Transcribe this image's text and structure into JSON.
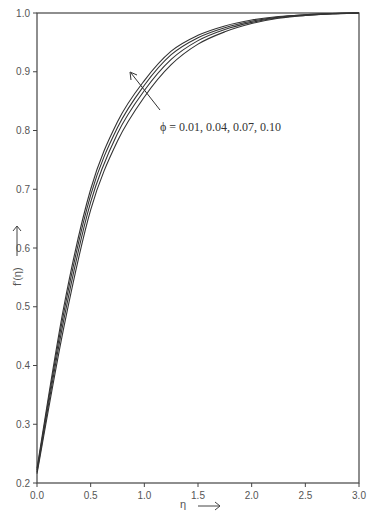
{
  "chart_data": {
    "type": "line",
    "title": "",
    "xlabel": "η",
    "ylabel": "f'(η)",
    "xlim": [
      0.0,
      3.0
    ],
    "ylim": [
      0.2,
      1.0
    ],
    "grid": false,
    "x_ticks": [
      "0.0",
      "0.5",
      "1.0",
      "1.5",
      "2.0",
      "2.5",
      "3.0"
    ],
    "y_ticks": [
      "0.2",
      "0.3",
      "0.4",
      "0.5",
      "0.6",
      "0.7",
      "0.8",
      "0.9",
      "1.0"
    ],
    "annotation": {
      "text": "ϕ = 0.01, 0.04, 0.07, 0.10",
      "arrow": "pointing up-left, indicating increasing ϕ direction"
    },
    "x": [
      0.0,
      0.25,
      0.5,
      0.75,
      1.0,
      1.25,
      1.5,
      1.75,
      2.0,
      2.25,
      2.5,
      2.75,
      3.0
    ],
    "series": [
      {
        "name": "ϕ = 0.01",
        "values": [
          0.225,
          0.5,
          0.7,
          0.815,
          0.885,
          0.935,
          0.962,
          0.978,
          0.988,
          0.994,
          0.997,
          0.999,
          1.0
        ]
      },
      {
        "name": "ϕ = 0.04",
        "values": [
          0.222,
          0.49,
          0.69,
          0.805,
          0.877,
          0.929,
          0.958,
          0.975,
          0.986,
          0.993,
          0.997,
          0.999,
          1.0
        ]
      },
      {
        "name": "ϕ = 0.07",
        "values": [
          0.219,
          0.478,
          0.678,
          0.795,
          0.868,
          0.921,
          0.953,
          0.972,
          0.984,
          0.992,
          0.996,
          0.999,
          1.0
        ]
      },
      {
        "name": "ϕ = 0.10",
        "values": [
          0.216,
          0.465,
          0.665,
          0.782,
          0.857,
          0.912,
          0.947,
          0.968,
          0.982,
          0.991,
          0.996,
          0.999,
          1.0
        ]
      }
    ],
    "line_color": "#333333"
  }
}
